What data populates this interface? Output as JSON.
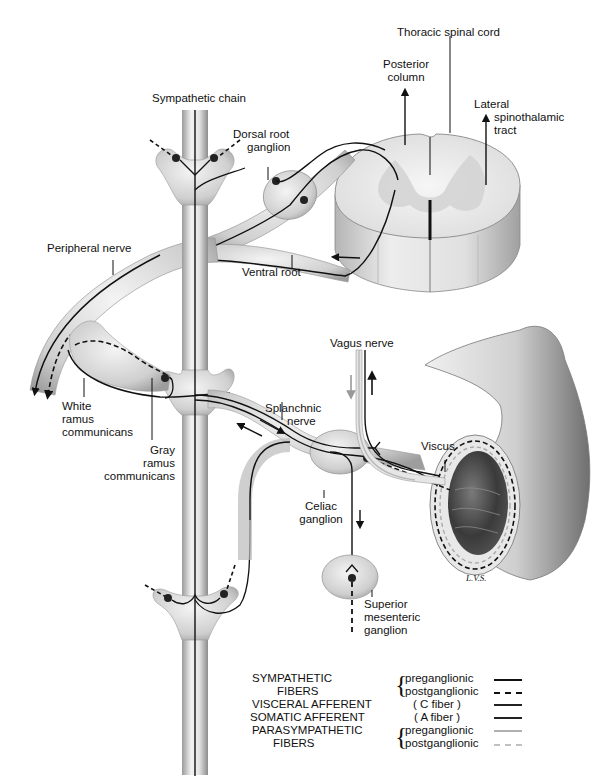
{
  "labels": {
    "thoracic_spinal_cord": "Thoracic spinal cord",
    "posterior_column_1": "Posterior",
    "posterior_column_2": "column",
    "lateral_1": "Lateral",
    "lateral_2": "spinothalamic",
    "lateral_3": "tract",
    "sympathetic_chain": "Sympathetic chain",
    "dorsal_root_1": "Dorsal root",
    "dorsal_root_2": "ganglion",
    "peripheral_nerve": "Peripheral nerve",
    "ventral_root": "Ventral root",
    "vagus_nerve": "Vagus nerve",
    "white_ramus_1": "White",
    "white_ramus_2": "ramus",
    "white_ramus_3": "communicans",
    "gray_ramus_1": "Gray",
    "gray_ramus_2": "ramus",
    "gray_ramus_3": "communicans",
    "splanchnic_1": "Splanchnic",
    "splanchnic_2": "nerve",
    "viscus": "Viscus",
    "celiac_1": "Celiac",
    "celiac_2": "ganglion",
    "sup_mes_1": "Superior",
    "sup_mes_2": "mesenteric",
    "sup_mes_3": "ganglion",
    "signature": "L.V.S."
  },
  "legend": {
    "sympathetic_1": "SYMPATHETIC",
    "sympathetic_2": "FIBERS",
    "symp_pre": "preganglionic",
    "symp_post": "postganglionic",
    "visceral": "VISCERAL AFFERENT",
    "visceral_type": "( C  fiber )",
    "somatic": "SOMATIC AFFERENT",
    "somatic_type": "( A  fiber )",
    "parasympathetic_1": "PARASYMPATHETIC",
    "parasympathetic_2": "FIBERS",
    "para_pre": "preganglionic",
    "para_post": "postganglionic",
    "colors": {
      "sympathetic_pre": "#111111",
      "sympathetic_post": "#111111",
      "visceral_afferent": "#222222",
      "somatic_afferent": "#222222",
      "parasympathetic_pre": "#b0b0b0",
      "parasympathetic_post": "#c0c0c0"
    }
  }
}
